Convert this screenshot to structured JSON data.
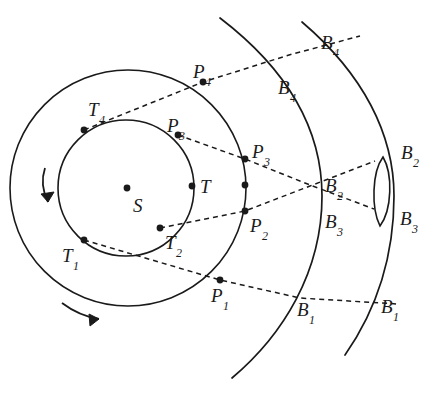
{
  "figure": {
    "background_color": "#ffffff",
    "stroke_color": "#1a1a1a",
    "width": 438,
    "height": 395
  },
  "center": {
    "label": "S",
    "name": "sun-center-point",
    "x": 127,
    "y": 188,
    "label_x": 133,
    "label_y": 196
  },
  "circles": {
    "inner": {
      "name": "inner-circle",
      "cx": 126,
      "cy": 188,
      "r": 68,
      "stroke_width": 1.6
    },
    "outer": {
      "name": "outer-circle",
      "cx": 128,
      "cy": 188,
      "r": 118,
      "stroke_width": 1.6
    }
  },
  "arcs": {
    "inner_sphere": {
      "name": "inner-sphere-arc",
      "path": "M 220 18 C 288 70, 322 130, 322 196 C 322 272, 283 335, 232 378",
      "stroke_width": 1.7
    },
    "outer_sphere": {
      "name": "outer-sphere-arc",
      "path": "M 302 22 C 363 74, 394 134, 394 196 C 394 258, 375 312, 345 355",
      "stroke_width": 1.7
    },
    "lens": {
      "name": "epicycle-lens-shape",
      "path": "M 383 157 C 372 172, 371 208, 380 226 C 392 210, 393 174, 383 157 Z",
      "stroke_width": 1.6
    }
  },
  "rays": [
    {
      "name": "ray-4",
      "from": "T4",
      "path": "M 84 130 L 203 82 L 289 55 L 360 36",
      "dash": "5,4"
    },
    {
      "name": "ray-3",
      "from": "P3",
      "path": "M 178 135 L 245 159 L 310 185 L 374 209",
      "dash": "5,4"
    },
    {
      "name": "ray-2",
      "from": "T2",
      "path": "M 160 228 L 245 211 L 310 186 L 375 161",
      "dash": "5,4"
    },
    {
      "name": "ray-1",
      "from": "T1",
      "path": "M 84 240 L 220 280 L 300 298 L 398 304",
      "dash": "5,4"
    }
  ],
  "points": [
    {
      "name": "point-T4",
      "x": 84,
      "y": 130,
      "r": 3.4
    },
    {
      "name": "point-P3i",
      "x": 178,
      "y": 135,
      "r": 3.4
    },
    {
      "name": "point-T",
      "x": 192,
      "y": 186,
      "r": 3.4
    },
    {
      "name": "point-T2",
      "x": 160,
      "y": 228,
      "r": 3.4
    },
    {
      "name": "point-T1",
      "x": 84,
      "y": 240,
      "r": 3.4
    },
    {
      "name": "point-P4",
      "x": 203,
      "y": 82,
      "r": 3.4
    },
    {
      "name": "point-P3o",
      "x": 245,
      "y": 159,
      "r": 3.4
    },
    {
      "name": "point-mid",
      "x": 245,
      "y": 185,
      "r": 3.4
    },
    {
      "name": "point-P2",
      "x": 245,
      "y": 211,
      "r": 3.4
    },
    {
      "name": "point-P1",
      "x": 220,
      "y": 280,
      "r": 3.4
    }
  ],
  "arrows": {
    "inner_rotation": {
      "name": "inner-rotation-arrow",
      "path": "M 45 168 C 41 180, 43 192, 48 202",
      "head": "M 48 202 L 41 194 L 54 192 Z"
    },
    "outer_rotation": {
      "name": "outer-rotation-arrow",
      "path": "M 62 303 C 74 312, 86 317, 99 319",
      "head": "M 99 319 L 89 314 L 90 326 Z"
    }
  },
  "labels": [
    {
      "name": "label-S",
      "base": "S",
      "sub": "",
      "x": 133,
      "y": 196
    },
    {
      "name": "label-T",
      "base": "T",
      "sub": "",
      "x": 200,
      "y": 177
    },
    {
      "name": "label-T1",
      "base": "T",
      "sub": "1",
      "x": 62,
      "y": 246
    },
    {
      "name": "label-T2",
      "base": "T",
      "sub": "2",
      "x": 165,
      "y": 233
    },
    {
      "name": "label-T4",
      "base": "T",
      "sub": "4",
      "x": 88,
      "y": 100
    },
    {
      "name": "label-P1",
      "base": "P",
      "sub": "1",
      "x": 211,
      "y": 286
    },
    {
      "name": "label-P2",
      "base": "P",
      "sub": "2",
      "x": 250,
      "y": 216
    },
    {
      "name": "label-P3-inner",
      "base": "P",
      "sub": "3",
      "x": 167,
      "y": 116
    },
    {
      "name": "label-P3-outer",
      "base": "P",
      "sub": "3",
      "x": 252,
      "y": 142
    },
    {
      "name": "label-P4",
      "base": "P",
      "sub": "4",
      "x": 193,
      "y": 62
    },
    {
      "name": "label-B1-inner",
      "base": "B",
      "sub": "1",
      "x": 297,
      "y": 300
    },
    {
      "name": "label-B1-outer",
      "base": "B",
      "sub": "1",
      "x": 381,
      "y": 297
    },
    {
      "name": "label-B2-inner",
      "base": "B",
      "sub": "2",
      "x": 325,
      "y": 176
    },
    {
      "name": "label-B2-outer",
      "base": "B",
      "sub": "2",
      "x": 401,
      "y": 143
    },
    {
      "name": "label-B3-inner",
      "base": "B",
      "sub": "3",
      "x": 325,
      "y": 212
    },
    {
      "name": "label-B3-outer",
      "base": "B",
      "sub": "3",
      "x": 400,
      "y": 209
    },
    {
      "name": "label-B4-inner",
      "base": "B",
      "sub": "4",
      "x": 278,
      "y": 78
    },
    {
      "name": "label-B4-outer",
      "base": "B",
      "sub": "4",
      "x": 321,
      "y": 33
    }
  ]
}
